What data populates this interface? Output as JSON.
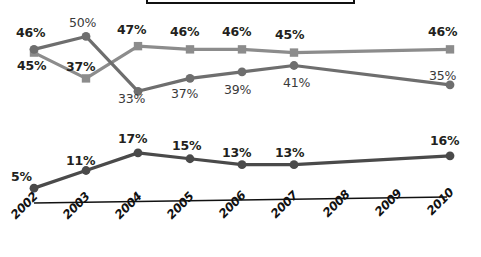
{
  "chart_data": {
    "type": "line",
    "title": "",
    "xlabel": "",
    "ylabel": "",
    "grid": false,
    "legend_position": "none",
    "categories": [
      "2002",
      "2003",
      "2004",
      "2005",
      "2006",
      "2007",
      "2008",
      "2009",
      "2010"
    ],
    "panels": [
      {
        "name": "upper-panel",
        "ylim": [
          30,
          52
        ],
        "series": [
          {
            "name": "square-series",
            "marker": "square",
            "color": "#8c8c8c",
            "label_style": "bold",
            "x": [
              "2002",
              "2003",
              "2004",
              "2005",
              "2006",
              "2007",
              "2010"
            ],
            "values": [
              45,
              37,
              47,
              46,
              46,
              45,
              46
            ],
            "labels": [
              "45%",
              "37%",
              "47%",
              "46%",
              "46%",
              "45%",
              "46%"
            ]
          },
          {
            "name": "circle-series",
            "marker": "circle",
            "color": "#6e6e6e",
            "label_style": "light",
            "x": [
              "2002",
              "2003",
              "2004",
              "2005",
              "2006",
              "2007",
              "2010"
            ],
            "values": [
              46,
              50,
              33,
              37,
              39,
              41,
              35
            ],
            "labels": [
              "46%",
              "50%",
              "33%",
              "37%",
              "39%",
              "41%",
              "35%"
            ]
          }
        ]
      },
      {
        "name": "lower-panel",
        "ylim": [
          3,
          19
        ],
        "series": [
          {
            "name": "bottom-series",
            "marker": "circle",
            "color": "#4a4a4a",
            "label_style": "bold",
            "x": [
              "2002",
              "2003",
              "2004",
              "2005",
              "2006",
              "2007",
              "2010"
            ],
            "values": [
              5,
              11,
              17,
              15,
              13,
              13,
              16
            ],
            "labels": [
              "5%",
              "11%",
              "17%",
              "15%",
              "13%",
              "13%",
              "16%"
            ]
          }
        ]
      }
    ],
    "colors": {
      "square_series": "#8c8c8c",
      "circle_series": "#6e6e6e",
      "bottom_series": "#4a4a4a",
      "axis": "#111111",
      "label_text": "#231f20",
      "background": "#ffffff"
    }
  },
  "upper": {
    "square_labels": [
      {
        "text": "45%",
        "x": 17,
        "y": 60
      },
      {
        "text": "37%",
        "x": 66,
        "y": 61
      },
      {
        "text": "47%",
        "x": 117,
        "y": 24
      },
      {
        "text": "46%",
        "x": 170,
        "y": 26
      },
      {
        "text": "46%",
        "x": 222,
        "y": 26
      },
      {
        "text": "45%",
        "x": 275,
        "y": 29
      },
      {
        "text": "46%",
        "x": 428,
        "y": 26
      }
    ],
    "circle_labels": [
      {
        "text": "46%",
        "x": 16,
        "y": 27
      },
      {
        "text": "50%",
        "x": 69,
        "y": 17
      },
      {
        "text": "33%",
        "x": 118,
        "y": 93
      },
      {
        "text": "37%",
        "x": 171,
        "y": 88
      },
      {
        "text": "39%",
        "x": 224,
        "y": 84
      },
      {
        "text": "41%",
        "x": 283,
        "y": 77
      },
      {
        "text": "35%",
        "x": 429,
        "y": 70
      }
    ]
  },
  "lower": {
    "labels": [
      {
        "text": "5%",
        "x": 11,
        "y": 171
      },
      {
        "text": "11%",
        "x": 66,
        "y": 155
      },
      {
        "text": "17%",
        "x": 118,
        "y": 133
      },
      {
        "text": "15%",
        "x": 172,
        "y": 140
      },
      {
        "text": "13%",
        "x": 222,
        "y": 147
      },
      {
        "text": "13%",
        "x": 275,
        "y": 147
      },
      {
        "text": "16%",
        "x": 430,
        "y": 135
      }
    ]
  },
  "axis": {
    "ticks": [
      {
        "label": "2002",
        "x": 18,
        "y": 216
      },
      {
        "label": "2003",
        "x": 70,
        "y": 216
      },
      {
        "label": "2004",
        "x": 122,
        "y": 216
      },
      {
        "label": "2005",
        "x": 174,
        "y": 216
      },
      {
        "label": "2006",
        "x": 226,
        "y": 216
      },
      {
        "label": "2007",
        "x": 278,
        "y": 216
      },
      {
        "label": "2008",
        "x": 330,
        "y": 216
      },
      {
        "label": "2009",
        "x": 382,
        "y": 216
      },
      {
        "label": "2010",
        "x": 434,
        "y": 216
      }
    ]
  }
}
